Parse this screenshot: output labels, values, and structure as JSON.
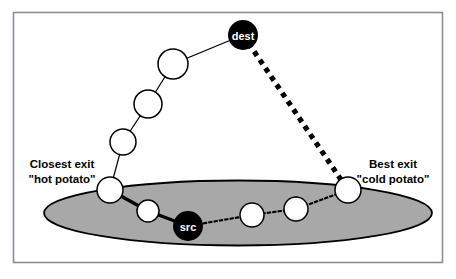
{
  "figure": {
    "frame": {
      "border_color": "#8c8c9a",
      "background_color": "#ffffff",
      "x": 13,
      "y": 12,
      "width": 430,
      "height": 251
    },
    "colors": {
      "as_cloud_fill": "#a8a8a8",
      "as_cloud_stroke": "#000000",
      "node_fill": "#ffffff",
      "node_stroke": "#000000",
      "endpoint_fill": "#000000",
      "endpoint_text": "#ffffff",
      "link_color": "#000000"
    },
    "as_cloud": {
      "name": "local-as-ellipse",
      "cx": 238,
      "cy": 213,
      "rx": 194,
      "ry": 32.5
    },
    "endpoints": [
      {
        "id": "src",
        "label": "src",
        "cx": 188,
        "cy": 226,
        "r": 15
      },
      {
        "id": "dest",
        "label": "dest",
        "cx": 243,
        "cy": 35,
        "r": 15
      }
    ],
    "routers": [
      {
        "id": "r-up-1",
        "cx": 173,
        "cy": 64,
        "r": 15
      },
      {
        "id": "r-up-2",
        "cx": 148,
        "cy": 104,
        "r": 14
      },
      {
        "id": "r-up-3",
        "cx": 123,
        "cy": 142,
        "r": 13
      },
      {
        "id": "exit-left",
        "cx": 110,
        "cy": 190,
        "r": 13
      },
      {
        "id": "r-in-1",
        "cx": 148,
        "cy": 211,
        "r": 11
      },
      {
        "id": "r-in-2",
        "cx": 252,
        "cy": 215,
        "r": 12
      },
      {
        "id": "r-in-3",
        "cx": 296,
        "cy": 209,
        "r": 12
      },
      {
        "id": "exit-right",
        "cx": 348,
        "cy": 190,
        "r": 13
      }
    ],
    "links": {
      "upper_path": {
        "name": "thin-solid-path-to-dest",
        "style": "thin-solid",
        "points": [
          [
            110,
            190
          ],
          [
            123,
            142
          ],
          [
            148,
            104
          ],
          [
            173,
            64
          ],
          [
            243,
            35
          ]
        ]
      },
      "hot_potato_path": {
        "name": "thick-solid-hot-potato-path",
        "style": "thick-solid",
        "points": [
          [
            188,
            226
          ],
          [
            148,
            211
          ],
          [
            110,
            190
          ]
        ]
      },
      "cold_potato_inner_path": {
        "name": "dotted-cold-potato-path",
        "style": "fine-dotted",
        "points": [
          [
            188,
            226
          ],
          [
            252,
            215
          ],
          [
            296,
            209
          ],
          [
            348,
            190
          ]
        ]
      },
      "cold_potato_outer_path": {
        "name": "thick-dotted-path-to-dest",
        "style": "thick-dotted",
        "points": [
          [
            243,
            35
          ],
          [
            348,
            190
          ]
        ]
      }
    },
    "annotations": [
      {
        "id": "closest-exit",
        "line1": "Closest exit",
        "line2": "\"hot potato\"",
        "x": 62,
        "y1": 164,
        "y2": 179
      },
      {
        "id": "best-exit",
        "line1": "Best exit",
        "line2": "\"cold potato\"",
        "x": 393,
        "y1": 164,
        "y2": 179
      }
    ]
  }
}
